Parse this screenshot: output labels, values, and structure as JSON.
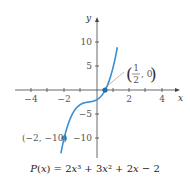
{
  "chart_data": {
    "type": "line",
    "title": "",
    "caption": "P(x) = 2x³ + 3x² + 2x − 2",
    "xlabel": "x",
    "ylabel": "y",
    "xlim": [
      -5,
      5
    ],
    "ylim": [
      -14,
      14
    ],
    "x_ticks": [
      -4,
      -2,
      2,
      4
    ],
    "y_ticks": [
      10,
      5,
      -5,
      -10
    ],
    "grid": false,
    "series": [
      {
        "name": "P(x)",
        "function": "2x^3 + 3x^2 + 2x - 2",
        "color": "#3a8fd0"
      }
    ],
    "points": [
      {
        "x": 0.5,
        "y": 0,
        "label": "(1/2, 0)"
      },
      {
        "x": -2,
        "y": -10,
        "label": "(-2, -10)"
      }
    ]
  },
  "labels": {
    "x_axis": "x",
    "y_axis": "y",
    "x_ticks": [
      "−4",
      "−2",
      "2",
      "4"
    ],
    "y_ticks": [
      "10",
      "5",
      "−5",
      "−10"
    ],
    "point_root_num": "1",
    "point_root_den": "2",
    "point_root_y": ", 0",
    "point_min": "(−2, −10)",
    "caption": "P(x) = 2x³ + 3x² + 2x − 2"
  }
}
